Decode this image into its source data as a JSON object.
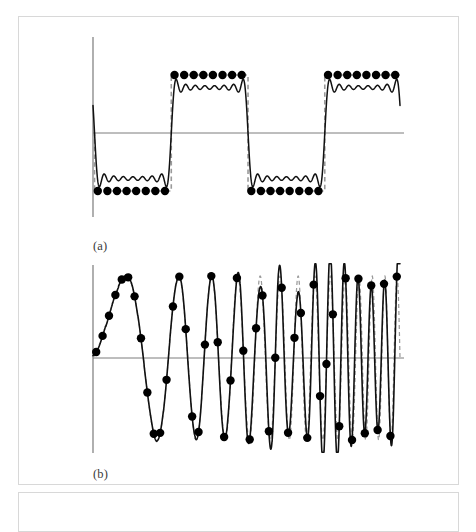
{
  "figure": {
    "background_color": "#ffffff",
    "panel_border_color": "#d8d8d8",
    "axis_color": "#6e6e6e",
    "signal_color": "#111111",
    "original_color": "#9a9a9a",
    "sample_marker_color": "#000000",
    "panels": [
      {
        "id": "panel-a",
        "label": "(a)",
        "description": "sampled square wave with reconstruction ringing"
      },
      {
        "id": "panel-b",
        "label": "(b)",
        "description": "chirp signal showing aliasing after sampling"
      }
    ]
  },
  "chart_data": [
    {
      "type": "line",
      "id": "panel-a",
      "title": "",
      "xlabel": "",
      "ylabel": "",
      "label": "(a)",
      "grid": false,
      "legend": "none",
      "xlim": [
        0,
        1
      ],
      "ylim": [
        -1.35,
        1.35
      ],
      "axis_origin_x": 0.0,
      "axis_y_value": 0.0,
      "series": [
        {
          "name": "ideal-square-wave",
          "style": "dashed",
          "color": "#9a9a9a",
          "waveform": "square",
          "amplitude": 1.0,
          "period": 0.5,
          "phase": -0.5,
          "x": [
            0.0,
            0.005,
            0.005,
            0.255,
            0.255,
            0.505,
            0.505,
            0.755,
            0.755,
            1.0
          ],
          "y": [
            0.0,
            0.0,
            -1.0,
            -1.0,
            1.0,
            1.0,
            -1.0,
            -1.0,
            1.0,
            1.0
          ]
        },
        {
          "name": "reconstructed-square-wave",
          "style": "solid",
          "color": "#111111",
          "note": "band-limited reconstruction with Gibbs overshoot at edges"
        },
        {
          "name": "samples",
          "style": "markers",
          "color": "#000000",
          "marker": "filled-circle",
          "marker_size_px": 4.2,
          "count": 32,
          "x": [
            0.0156,
            0.0469,
            0.0781,
            0.1094,
            0.1406,
            0.1719,
            0.2031,
            0.2344,
            0.2656,
            0.2969,
            0.3281,
            0.3594,
            0.3906,
            0.4219,
            0.4531,
            0.4844,
            0.5156,
            0.5469,
            0.5781,
            0.6094,
            0.6406,
            0.6719,
            0.7031,
            0.7344,
            0.7656,
            0.7969,
            0.8281,
            0.8594,
            0.8906,
            0.9219,
            0.9531,
            0.9844
          ],
          "y": [
            -1,
            -1,
            -1,
            -1,
            -1,
            -1,
            -1,
            -1,
            1,
            1,
            1,
            1,
            1,
            1,
            1,
            1,
            -1,
            -1,
            -1,
            -1,
            -1,
            -1,
            -1,
            -1,
            1,
            1,
            1,
            1,
            1,
            1,
            1,
            1
          ]
        }
      ]
    },
    {
      "type": "line",
      "id": "panel-b",
      "title": "",
      "xlabel": "",
      "ylabel": "",
      "label": "(b)",
      "grid": false,
      "legend": "none",
      "xlim": [
        0,
        1
      ],
      "ylim": [
        -1.2,
        1.2
      ],
      "axis_origin_x": 0.0,
      "axis_y_value": 0.0,
      "series": [
        {
          "name": "original-chirp",
          "style": "dashed",
          "color": "#9a9a9a",
          "waveform": "linear-chirp",
          "amplitude": 1.0,
          "start_cycles": 1.0,
          "end_cycles": 26.0,
          "note": "instantaneous frequency increases linearly, exceeds Nyquist"
        },
        {
          "name": "aliased-reconstruction",
          "style": "solid",
          "color": "#111111",
          "note": "apparent frequency folds back after exceeding Nyquist limit"
        },
        {
          "name": "samples",
          "style": "markers",
          "color": "#000000",
          "marker": "filled-circle",
          "marker_size_px": 4.2,
          "count": 48,
          "sample_rate_cycles": 48
        }
      ]
    }
  ]
}
